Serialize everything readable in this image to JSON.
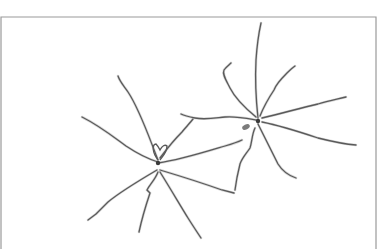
{
  "figure": {
    "colors": {
      "background": "#ffffff",
      "frame": "#9a9a9a",
      "process_stroke": "#5a5a5a",
      "process_tip": "#b8b8b8"
    },
    "frame": {
      "x": 1,
      "y": 17,
      "right": 376
    },
    "cells": [
      {
        "name": "cell-left",
        "soma": {
          "x": 158,
          "y": 163
        },
        "processes": [
          "M158,160 C150,140 140,110 128,92 C124,86 120,82 118,76",
          "M158,162 C145,158 135,152 126,146 C115,138 100,126 82,117",
          "M160,158 C166,150 174,140 182,132 C186,127 190,123 193,119",
          "M158,163 C180,160 205,152 225,146 C232,144 238,142 242,140",
          "M160,170 C180,176 205,184 222,190 C226,191 230,192 234,193",
          "M157,170 C140,180 120,192 108,202 C103,207 99,211 96,214 M96,214 L88,220",
          "M158,172 C155,180 150,184 147,190 L150,193 C146,205 142,218 139,232",
          "M160,172 C170,188 180,205 188,218 C193,226 197,232 201,238"
        ],
        "loop": "M158,160 C152,152 152,144 156,144 C158,146 159,148 160,150 C162,146 165,144 167,146 C167,152 163,156 160,160"
      },
      {
        "name": "cell-right",
        "soma": {
          "x": 258,
          "y": 121
        },
        "processes": [
          "M258,118 C256,100 255,80 256,60 C257,45 259,32 261,23",
          "M256,117 C245,108 235,98 230,88 C226,80 222,74 224,70 C226,67 229,65 231,63",
          "M260,116 C264,106 270,96 274,90 C276,84 282,78 287,73 C290,70 292,68 295,66",
          "M262,118 C280,114 300,108 318,104 C328,101 338,99 346,97",
          "M262,122 C282,126 300,132 318,138 C330,141 342,144 356,145",
          "M258,124 C265,138 272,152 278,164 C283,172 290,176 296,178",
          "M255,128 C252,134 252,142 250,148 C246,154 242,158 240,164 C238,172 236,182 235,190",
          "M256,120 C245,118 235,116 225,117 C215,118 205,120 195,118 C190,117 185,116 181,114"
        ],
        "knot": {
          "x": 246,
          "y": 127
        }
      }
    ]
  }
}
